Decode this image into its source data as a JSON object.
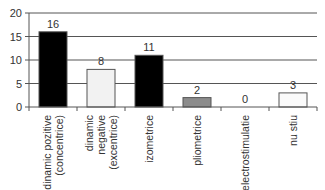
{
  "chart_data": {
    "type": "bar",
    "title": "",
    "xlabel": "",
    "ylabel": "",
    "ylim": [
      0,
      20
    ],
    "yticks": [
      0,
      5,
      10,
      15,
      20
    ],
    "grid": true,
    "legend": null,
    "categories": [
      [
        "dinamic pozitive",
        "(concentrice)"
      ],
      [
        "dinamic",
        "negative",
        "(excentrice)"
      ],
      [
        "izometrice"
      ],
      [
        "pliometrice"
      ],
      [
        "electrostimulatie"
      ],
      [
        "nu stiu"
      ]
    ],
    "values": [
      16,
      8,
      11,
      2,
      0,
      3
    ],
    "bar_colors": [
      "#000000",
      "#f2f2f2",
      "#000000",
      "#8c8c8c",
      "#ffffff",
      "#fafafa"
    ]
  }
}
